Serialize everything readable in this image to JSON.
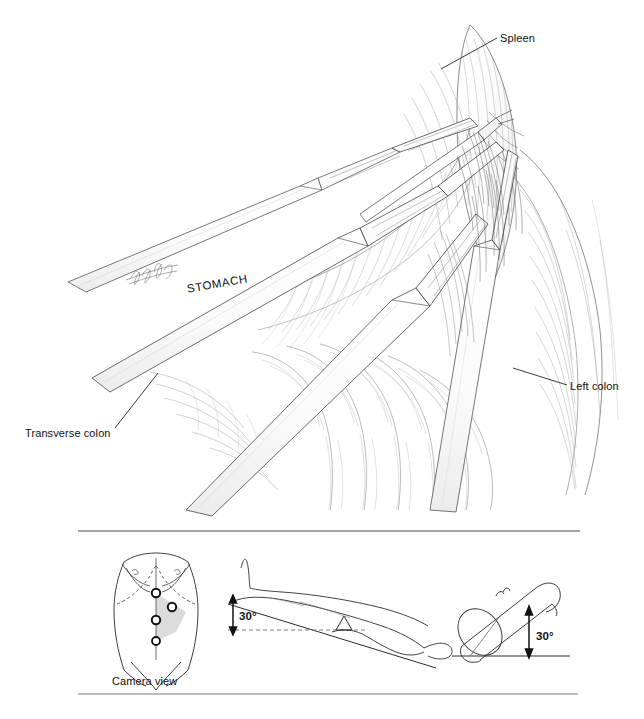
{
  "figure": {
    "kind": "medical-illustration",
    "technique": "pen-and-ink line drawing",
    "background_color": "#ffffff",
    "ink_color": "#1a1a1a",
    "signature_present": true
  },
  "main_illustration": {
    "name": "operative-view",
    "description": "Intra-abdominal laparoscopic view of the splenic flexure with retracting instruments converging from the lower left toward the spleen at upper right",
    "labels": [
      {
        "id": "spleen",
        "text": "Spleen",
        "x": 500,
        "y": 39,
        "anchor": "start",
        "leader": {
          "from_x": 497,
          "from_y": 38,
          "to_x": 441,
          "to_y": 69
        }
      },
      {
        "id": "stomach",
        "text": "STOMACH",
        "x": 186,
        "y": 291,
        "anchor": "start",
        "rotation": -10,
        "leader": null
      },
      {
        "id": "transverse-colon",
        "text": "Transverse colon",
        "x": 25,
        "y": 434,
        "anchor": "start",
        "leader": {
          "from_x": 115,
          "from_y": 428,
          "to_x": 158,
          "to_y": 373
        }
      },
      {
        "id": "left-colon",
        "text": "Left colon",
        "x": 570,
        "y": 387,
        "anchor": "start",
        "leader": {
          "from_x": 567,
          "from_y": 385,
          "to_x": 513,
          "to_y": 368
        }
      }
    ]
  },
  "lower_panel": {
    "name": "positioning-panel",
    "rules": [
      {
        "id": "rule-top",
        "x1": 78,
        "y1": 531,
        "x2": 580,
        "y2": 531
      },
      {
        "id": "rule-bottom",
        "x1": 78,
        "y1": 694,
        "x2": 578,
        "y2": 694
      }
    ],
    "diagrams": [
      {
        "id": "port-placement",
        "title": "Camera view",
        "title_x": 150,
        "title_y": 682,
        "description": "Anterior torso with four trocar port sites and a shaded camera view sector",
        "shade_color": "#d8d8d8",
        "ports": [
          {
            "id": "port-1",
            "cx": 156,
            "cy": 593,
            "r": 4.2
          },
          {
            "id": "port-2",
            "cx": 172,
            "cy": 607,
            "r": 4.2
          },
          {
            "id": "port-3",
            "cx": 156,
            "cy": 620,
            "r": 4.2
          },
          {
            "id": "port-4",
            "cx": 156,
            "cy": 641,
            "r": 4.0
          }
        ]
      },
      {
        "id": "table-tilt-lateral",
        "description": "Supine patient in reverse Trendelenburg, head elevated thirty degrees over a fulcrum",
        "angle_label": "30°",
        "angle_label_x": 244,
        "angle_label_y": 617,
        "arrow": {
          "x": 233,
          "y_top": 597,
          "y_bottom": 630
        }
      },
      {
        "id": "table-tilt-roll",
        "description": "Cylindrical torso rolled right side down at thirty degrees",
        "angle_label": "30°",
        "angle_label_x": 540,
        "angle_label_y": 637,
        "arrow": {
          "x": 529,
          "y_top": 610,
          "y_bottom": 655
        }
      }
    ]
  }
}
